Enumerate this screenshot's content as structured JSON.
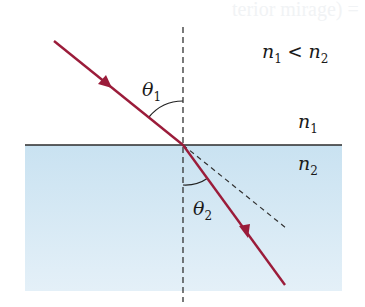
{
  "diagram": {
    "title_fragment": "terior mirage) =",
    "condition": {
      "n1": "n",
      "n1_sub": "1",
      "op": " < ",
      "n2": "n",
      "n2_sub": "2"
    },
    "medium_top": {
      "symbol": "n",
      "sub": "1"
    },
    "medium_bottom": {
      "symbol": "n",
      "sub": "2"
    },
    "angle_incident": {
      "symbol": "θ",
      "sub": "1"
    },
    "angle_refracted": {
      "symbol": "θ",
      "sub": "2"
    },
    "colors": {
      "ray": "#9b1c3a",
      "interface": "#2b2b2b",
      "normal": "#333333",
      "water_top": "#c9e2f1",
      "water_bottom": "#e4f0f8"
    }
  }
}
